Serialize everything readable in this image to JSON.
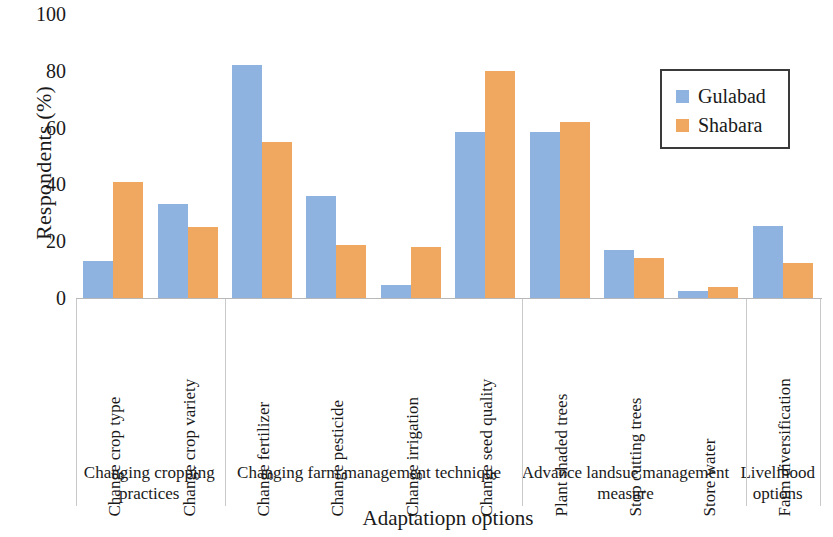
{
  "chart_data": {
    "type": "bar",
    "title": "",
    "xlabel": "Adaptatiopn options",
    "ylabel": "Respondents (%)",
    "ylim": [
      0,
      100
    ],
    "yticks": [
      100,
      80,
      60,
      40,
      20,
      0
    ],
    "grid": false,
    "legend_position": "top-right",
    "categories": [
      "Change crop type",
      "Change crop variety",
      "Change fertilizer",
      "Change pesticide",
      "Change irrigation",
      "Change seed quality",
      "Plant shaded trees",
      "Stop cutting trees",
      "Store water",
      "Farm diversification"
    ],
    "series": [
      {
        "name": "Gulabad",
        "color": "#8FB3E0",
        "values": [
          13,
          33,
          82,
          36,
          4.5,
          58.5,
          58.5,
          17,
          2.5,
          25.5
        ]
      },
      {
        "name": "Shabara",
        "color": "#F0A860",
        "values": [
          41,
          25,
          55,
          18.5,
          18,
          80,
          62,
          14,
          4,
          12.5
        ]
      }
    ],
    "groups": [
      {
        "label": "Changing cropping practices",
        "span": 2
      },
      {
        "label": "Changing farm management technique",
        "span": 4
      },
      {
        "label": "Advance landsue management measure",
        "span": 3
      },
      {
        "label": "Livelihood options",
        "span": 1
      }
    ]
  }
}
